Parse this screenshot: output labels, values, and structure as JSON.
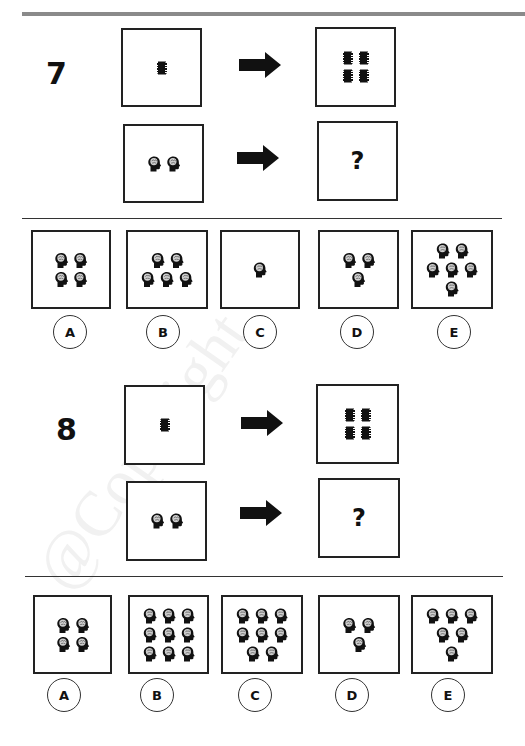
{
  "watermark": "@Copyright",
  "questions": [
    {
      "number": "7",
      "example": {
        "left_icon": "microchip-icon",
        "left_count": 1,
        "right_icon": "microchip-icon",
        "right_count": 4
      },
      "problem": {
        "left_icon": "brain-head-icon",
        "left_count": 2,
        "right": "?"
      },
      "options": [
        {
          "label": "A",
          "icon": "brain-head-icon",
          "count": 4,
          "rows": [
            2,
            2
          ]
        },
        {
          "label": "B",
          "icon": "brain-head-icon",
          "count": 5,
          "rows": [
            2,
            3
          ]
        },
        {
          "label": "C",
          "icon": "brain-head-icon",
          "count": 1,
          "rows": [
            1
          ]
        },
        {
          "label": "D",
          "icon": "brain-head-icon",
          "count": 3,
          "rows": [
            2,
            1
          ]
        },
        {
          "label": "E",
          "icon": "brain-head-icon",
          "count": 6,
          "rows": [
            2,
            3,
            1
          ]
        }
      ]
    },
    {
      "number": "8",
      "example": {
        "left_icon": "microchip-icon",
        "left_count": 1,
        "right_icon": "microchip-icon",
        "right_count": 4
      },
      "problem": {
        "left_icon": "brain-head-icon",
        "left_count": 2,
        "right": "?"
      },
      "options": [
        {
          "label": "A",
          "icon": "brain-head-icon",
          "count": 4,
          "rows": [
            2,
            2
          ]
        },
        {
          "label": "B",
          "icon": "brain-head-icon",
          "count": 9,
          "rows": [
            3,
            3,
            3
          ]
        },
        {
          "label": "C",
          "icon": "brain-head-icon",
          "count": 8,
          "rows": [
            3,
            3,
            2
          ]
        },
        {
          "label": "D",
          "icon": "brain-head-icon",
          "count": 3,
          "rows": [
            2,
            1
          ]
        },
        {
          "label": "E",
          "icon": "brain-head-icon",
          "count": 6,
          "rows": [
            3,
            2,
            1
          ]
        }
      ]
    }
  ]
}
